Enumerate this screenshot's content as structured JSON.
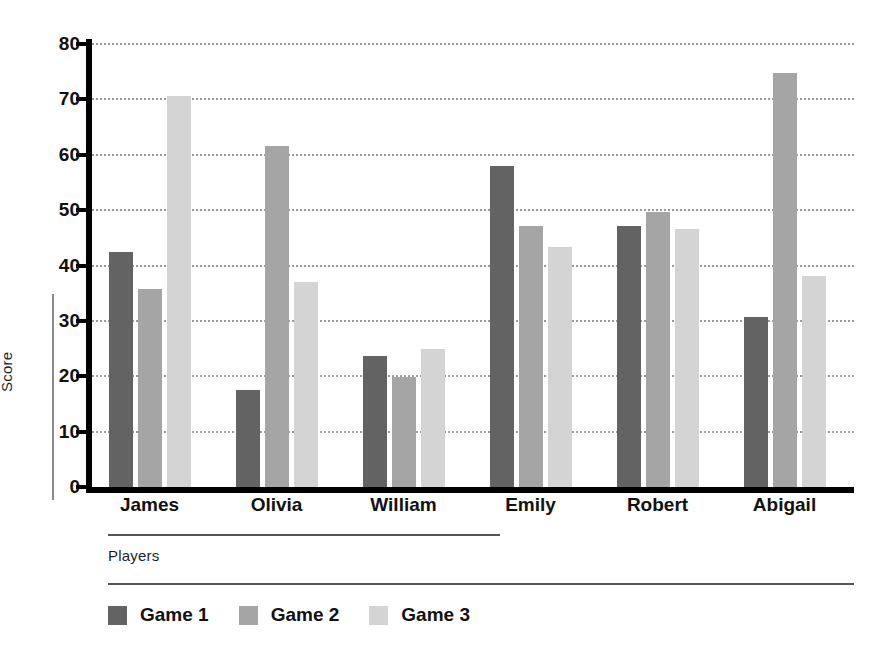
{
  "chart_data": {
    "type": "bar",
    "title": "",
    "subtitle": "",
    "xlabel": "Players",
    "ylabel": "Score",
    "categories": [
      "James",
      "Olivia",
      "William",
      "Emily",
      "Robert",
      "Abigail"
    ],
    "series": [
      {
        "name": "Game 1",
        "color": "#636363",
        "values": [
          42.5,
          17.6,
          23.7,
          58.0,
          47.1,
          30.7
        ]
      },
      {
        "name": "Game 2",
        "color": "#a5a5a5",
        "values": [
          35.7,
          61.5,
          19.8,
          47.1,
          49.7,
          74.7
        ]
      },
      {
        "name": "Game 3",
        "color": "#d4d4d4",
        "values": [
          70.7,
          37.0,
          24.9,
          43.3,
          46.6,
          38.1
        ]
      }
    ],
    "ylim": [
      0,
      80
    ],
    "yticks": [
      0,
      10,
      20,
      30,
      40,
      50,
      60,
      70,
      80
    ],
    "ytick_labels": [
      "0",
      "10",
      "20",
      "30",
      "40",
      "50",
      "60",
      "70",
      "80"
    ],
    "grid": "horizontal-dotted",
    "legend_position": "bottom-left",
    "legend_entries": [
      "Game 1",
      "Game 2",
      "Game 3"
    ]
  }
}
